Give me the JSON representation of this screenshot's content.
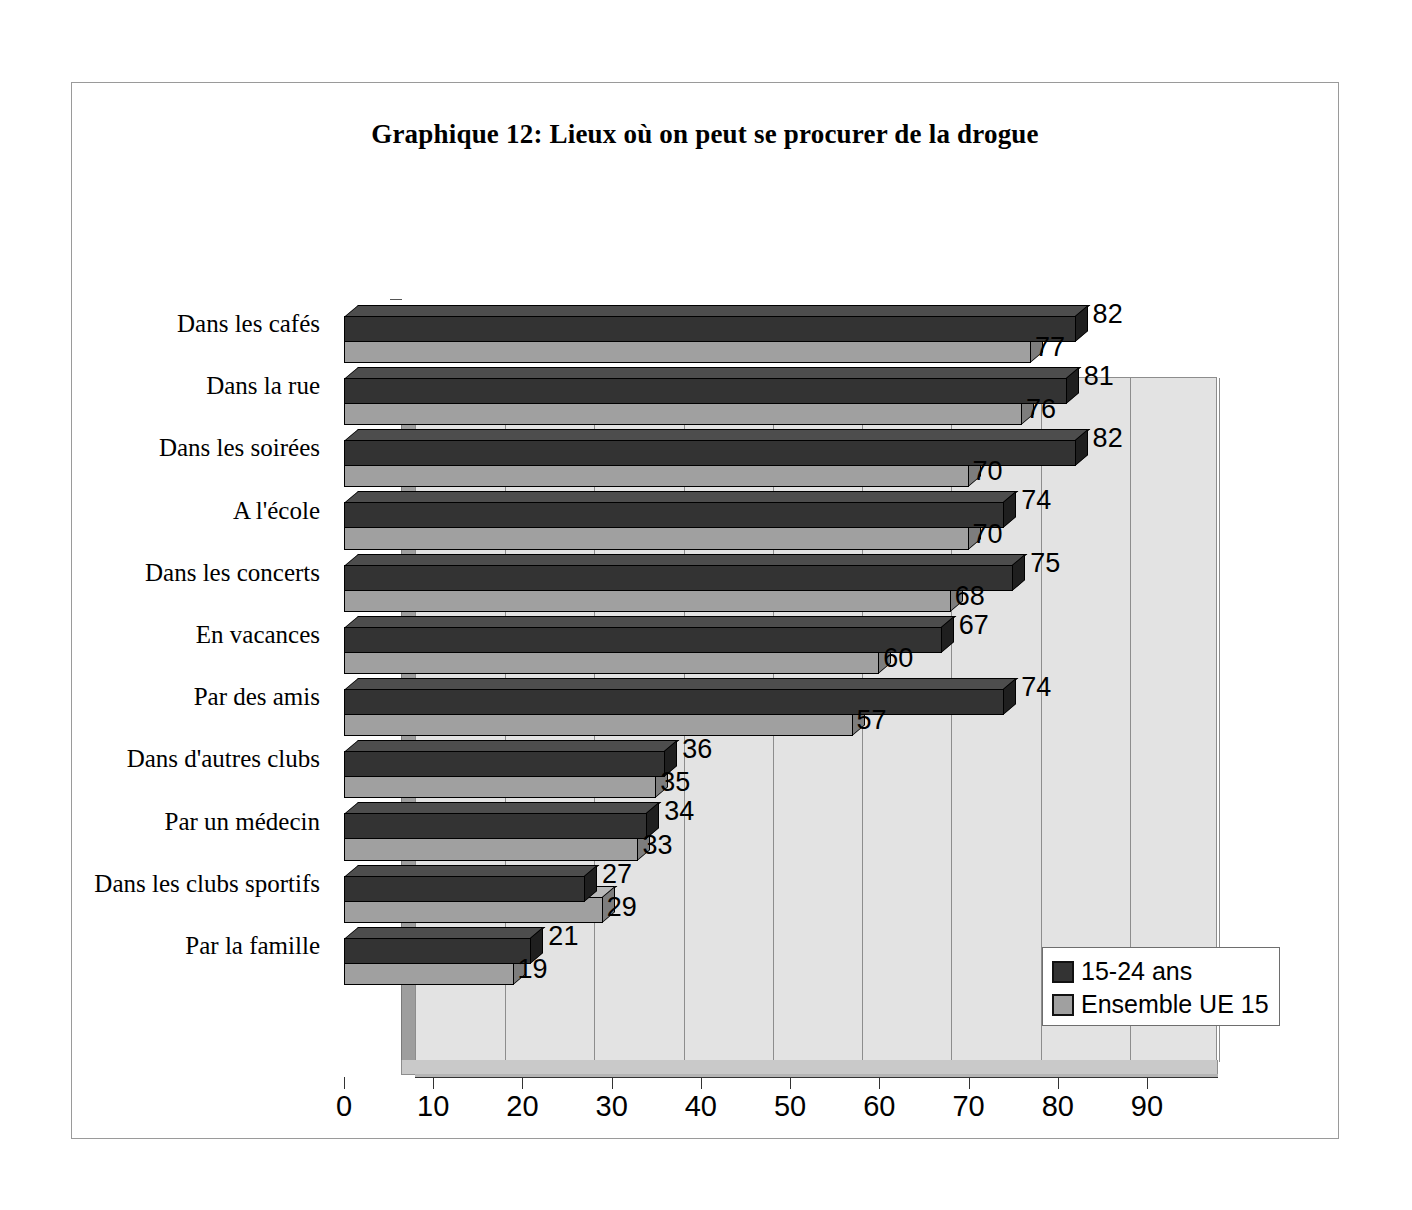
{
  "chart_data": {
    "type": "bar",
    "orientation": "horizontal",
    "title": "Graphique 12: Lieux où on peut se procurer de la drogue",
    "xlabel": "",
    "ylabel": "",
    "xlim": [
      0,
      90
    ],
    "xticks": [
      "0",
      "10",
      "20",
      "30",
      "40",
      "50",
      "60",
      "70",
      "80",
      "90"
    ],
    "grid": true,
    "legend_position": "bottom-right",
    "categories": [
      "Dans les cafés",
      "Dans la rue",
      "Dans les soirées",
      "A l'école",
      "Dans les concerts",
      "En vacances",
      "Par des amis",
      "Dans d'autres clubs",
      "Par un médecin",
      "Dans les clubs sportifs",
      "Par la famille"
    ],
    "series": [
      {
        "name": "15-24 ans",
        "color": "#333333",
        "values": [
          82,
          81,
          82,
          74,
          75,
          67,
          74,
          36,
          34,
          27,
          21
        ]
      },
      {
        "name": "Ensemble UE 15",
        "color": "#a0a0a0",
        "values": [
          77,
          76,
          70,
          70,
          68,
          60,
          57,
          35,
          33,
          29,
          19
        ]
      }
    ]
  },
  "legend": {
    "items": [
      {
        "label": "15-24 ans"
      },
      {
        "label": "Ensemble UE 15"
      }
    ]
  },
  "colors": {
    "series_dark": "#333333",
    "series_light": "#a0a0a0",
    "plot_background": "#e3e3e3",
    "frame_border": "#9a9a9a",
    "gridline": "#8d8d8d"
  }
}
